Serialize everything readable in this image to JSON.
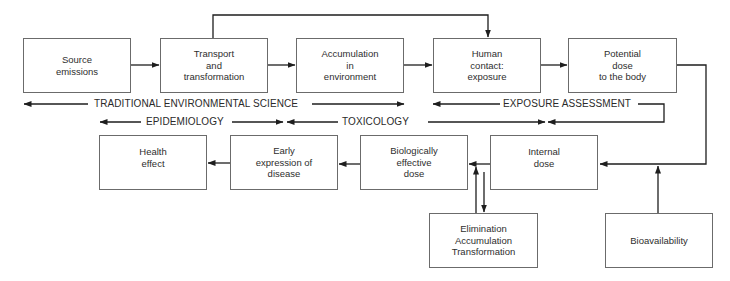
{
  "diagram": {
    "top_row": [
      {
        "id": "source",
        "label": "Source\nemissions"
      },
      {
        "id": "transport",
        "label": "Transport\nand\ntransformation"
      },
      {
        "id": "accumulation",
        "label": "Accumulation\nin\nenvironment"
      },
      {
        "id": "human-contact",
        "label": "Human\ncontact:\nexposure"
      },
      {
        "id": "potential-dose",
        "label": "Potential\ndose\nto the body"
      }
    ],
    "bottom_row": [
      {
        "id": "health-effect",
        "label": "Health\neffect"
      },
      {
        "id": "early-expression",
        "label": "Early\nexpression of\ndisease"
      },
      {
        "id": "biologically-effective",
        "label": "Biologically\neffective\ndose"
      },
      {
        "id": "internal-dose",
        "label": "Internal\ndose"
      }
    ],
    "auxiliary": [
      {
        "id": "elimination",
        "label": "Elimination\nAccumulation\nTransformation"
      },
      {
        "id": "bioavailability",
        "label": "Bioavailability"
      }
    ],
    "disciplines": {
      "traditional": "TRADITIONAL ENVIRONMENTAL SCIENCE",
      "exposure": "EXPOSURE ASSESSMENT",
      "epidemiology": "EPIDEMIOLOGY",
      "toxicology": "TOXICOLOGY"
    },
    "edges": [
      {
        "from": "source",
        "to": "transport"
      },
      {
        "from": "transport",
        "to": "accumulation"
      },
      {
        "from": "accumulation",
        "to": "human-contact"
      },
      {
        "from": "transport",
        "to": "human-contact"
      },
      {
        "from": "human-contact",
        "to": "potential-dose"
      },
      {
        "from": "potential-dose",
        "to": "internal-dose"
      },
      {
        "from": "bioavailability",
        "to": "internal-dose"
      },
      {
        "from": "internal-dose",
        "to": "biologically-effective"
      },
      {
        "from": "elimination",
        "to": "biologically-effective"
      },
      {
        "from": "internal-dose",
        "to": "elimination"
      },
      {
        "from": "biologically-effective",
        "to": "early-expression"
      },
      {
        "from": "early-expression",
        "to": "health-effect"
      }
    ]
  }
}
